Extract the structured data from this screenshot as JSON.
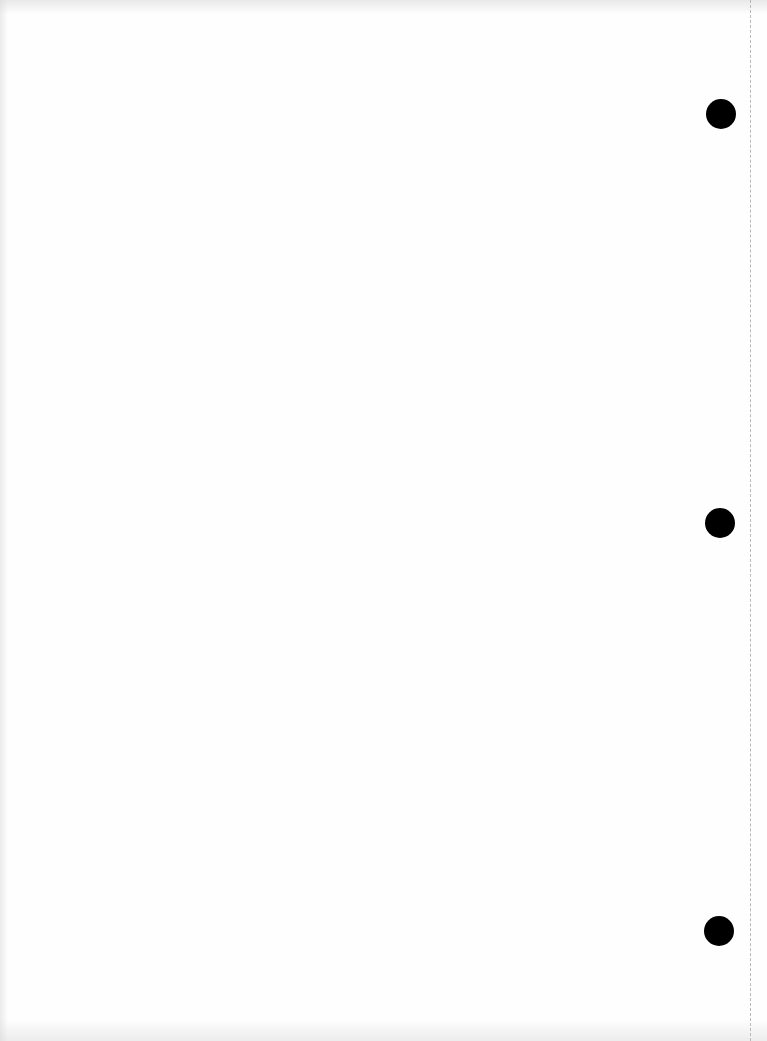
{
  "document": {
    "type": "blank-page",
    "text": "",
    "background_color": "#fefefe"
  },
  "hole_punches": [
    {
      "name": "top",
      "center_x": 721,
      "center_y": 114,
      "diameter": 30,
      "color": "#000000"
    },
    {
      "name": "middle",
      "center_x": 720,
      "center_y": 523,
      "diameter": 30,
      "color": "#000000"
    },
    {
      "name": "bottom",
      "center_x": 719,
      "center_y": 931,
      "diameter": 30,
      "color": "#000000"
    }
  ],
  "perforation_line": {
    "x": 750,
    "style": "dashed",
    "color": "#b8b8b8"
  }
}
